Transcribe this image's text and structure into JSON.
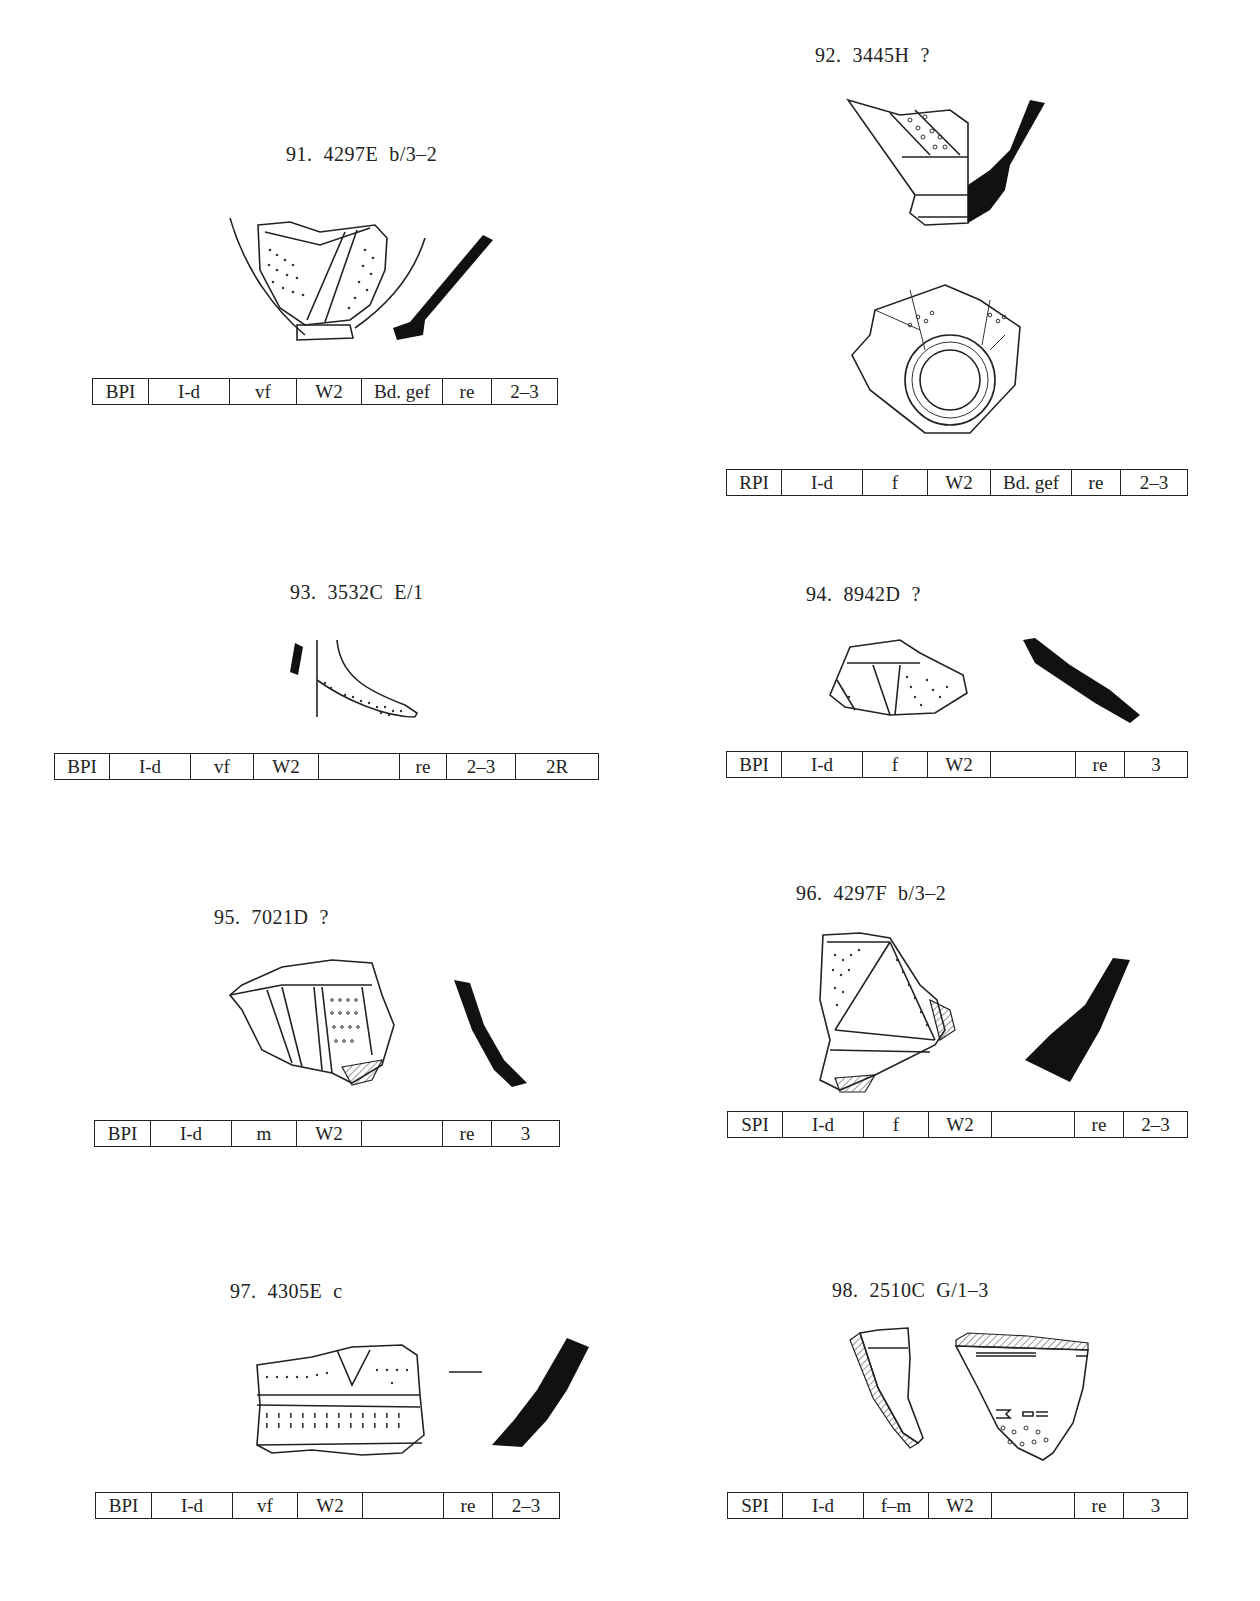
{
  "page": {
    "header_fragment": "g                                    /"
  },
  "entries": [
    {
      "id": "91",
      "caption": "91.  4297E  b/3–2",
      "table": [
        "BPI",
        "I-d",
        "vf",
        "W2",
        "Bd. gef",
        "re",
        "2–3"
      ]
    },
    {
      "id": "92",
      "caption": "92.  3445H  ?",
      "table": [
        "RPI",
        "I-d",
        "f",
        "W2",
        "Bd. gef",
        "re",
        "2–3"
      ]
    },
    {
      "id": "93",
      "caption": "93.  3532C  E/1",
      "table": [
        "BPI",
        "I-d",
        "vf",
        "W2",
        "",
        "re",
        "2–3",
        "2R"
      ]
    },
    {
      "id": "94",
      "caption": "94.  8942D  ?",
      "table": [
        "BPI",
        "I-d",
        "f",
        "W2",
        "",
        "re",
        "3"
      ]
    },
    {
      "id": "95",
      "caption": "95.  7021D  ?",
      "table": [
        "BPI",
        "I-d",
        "m",
        "W2",
        "",
        "re",
        "3"
      ]
    },
    {
      "id": "96",
      "caption": "96.  4297F  b/3–2",
      "table": [
        "SPI",
        "I-d",
        "f",
        "W2",
        "",
        "re",
        "2–3"
      ]
    },
    {
      "id": "97",
      "caption": "97.  4305E  c",
      "table": [
        "BPI",
        "I-d",
        "vf",
        "W2",
        "",
        "re",
        "2–3"
      ]
    },
    {
      "id": "98",
      "caption": "98.  2510C  G/1–3",
      "table": [
        "SPI",
        "I-d",
        "f–m",
        "W2",
        "",
        "re",
        "3"
      ]
    }
  ]
}
